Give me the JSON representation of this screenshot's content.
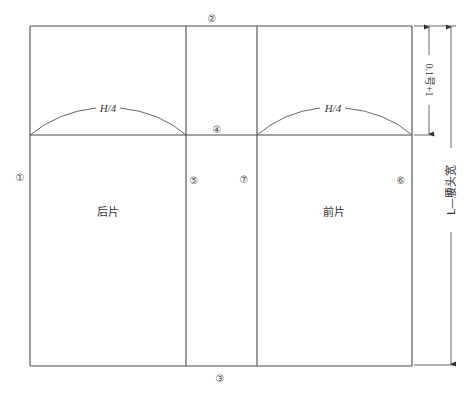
{
  "diagram": {
    "type": "pattern-draft",
    "labels": {
      "back_piece": "后片",
      "front_piece": "前片",
      "arc_back": "H/4",
      "arc_front": "H/4",
      "dim_top": "0.1号+1",
      "dim_total": "L—腰头宽"
    },
    "line_markers": {
      "m1": "①",
      "m2": "②",
      "m3": "③",
      "m4": "④",
      "m5": "⑤",
      "m6": "⑥",
      "m7": "⑦"
    },
    "colors": {
      "line": "#4a4a4a",
      "text": "#333333",
      "background": "#ffffff"
    }
  }
}
